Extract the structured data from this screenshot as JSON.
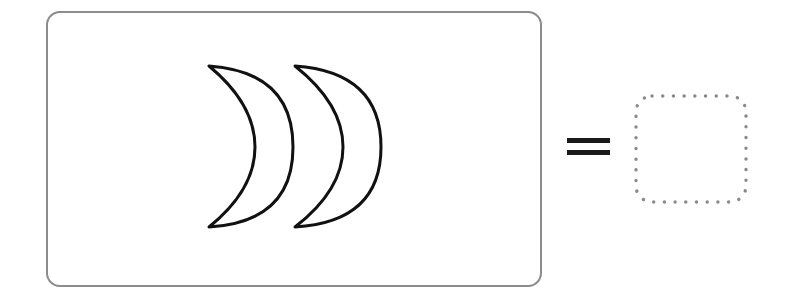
{
  "puzzle": {
    "description": "Count the crescent moons and write the number in the empty box",
    "question_box": {
      "border_color": "#8c8c8c",
      "items": [
        {
          "shape": "crescent-moon",
          "label": "crescent moon 1"
        },
        {
          "shape": "crescent-moon",
          "label": "crescent moon 2"
        }
      ],
      "item_count_visible": 2
    },
    "operator": {
      "symbol": "=",
      "color": "#1a1a1a"
    },
    "answer_box": {
      "value": "",
      "style": "dotted",
      "dot_color": "#8a8a8a"
    },
    "colors": {
      "stroke": "#111111",
      "background": "#ffffff"
    }
  }
}
